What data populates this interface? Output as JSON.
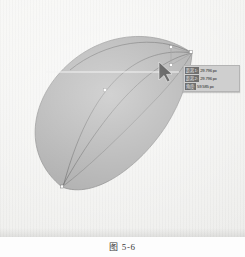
{
  "figure": {
    "caption": "图 5-6"
  },
  "artwork": {
    "shape_name": "leaf-petal-shape",
    "fill_color": "#9a9a9a",
    "stroke_color": "#5c5c5c",
    "guide_color": "#e9e9e9",
    "anchor_point_count": 5
  },
  "tooltip": {
    "rows": [
      {
        "key": "距离 1:",
        "value": "29.796 px"
      },
      {
        "key": "距离 2:",
        "value": "29.796 px"
      },
      {
        "key": "角度:",
        "value": "59.585 px"
      }
    ],
    "background_color": "#cfcfcf"
  },
  "cursor": {
    "type": "arrow-pointer",
    "x": 163,
    "y": 70
  }
}
